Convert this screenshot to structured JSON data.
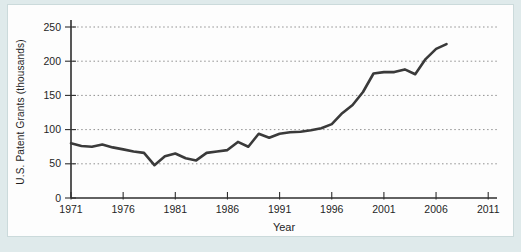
{
  "figure": {
    "kind": "scanned textbook line chart",
    "x_axis_title": "Year",
    "y_axis_title": "U.S. Patent Grants (thousands)"
  },
  "chart_data": {
    "type": "line",
    "title": "",
    "xlabel": "Year",
    "ylabel": "U.S. Patent Grants (thousands)",
    "xlim": [
      1971,
      2012
    ],
    "ylim": [
      0,
      250
    ],
    "x_ticks": [
      1971,
      1976,
      1981,
      1986,
      1991,
      1996,
      2001,
      2006,
      2011
    ],
    "y_ticks": [
      0,
      50,
      100,
      150,
      200,
      250
    ],
    "grid": "horizontal dotted lines at each y tick",
    "legend": "none",
    "series": [
      {
        "name": "U.S. patent grants (thousands)",
        "x": [
          1971,
          1972,
          1973,
          1974,
          1975,
          1976,
          1977,
          1978,
          1979,
          1980,
          1981,
          1982,
          1983,
          1984,
          1985,
          1986,
          1987,
          1988,
          1989,
          1990,
          1991,
          1992,
          1993,
          1994,
          1995,
          1996,
          1997,
          1998,
          1999,
          2000,
          2001,
          2002,
          2003,
          2004,
          2005,
          2006,
          2007
        ],
        "values": [
          80,
          76,
          75,
          78,
          74,
          71,
          68,
          66,
          48,
          61,
          65,
          58,
          55,
          66,
          68,
          70,
          82,
          75,
          94,
          88,
          94,
          96,
          97,
          99,
          102,
          108,
          124,
          136,
          155,
          182,
          184,
          184,
          188,
          181,
          203,
          218,
          225
        ]
      }
    ]
  },
  "colors": {
    "page_bg": "#dfeaeb",
    "panel_bg": "#fdfdfd",
    "panel_border": "#cbdadb",
    "line": "#3a3a3a",
    "axis": "#2e2e2e",
    "grid": "#8f8f8f",
    "text": "#1f1f1f"
  }
}
